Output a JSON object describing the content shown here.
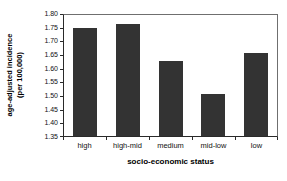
{
  "figure": {
    "background": "#ffffff"
  },
  "chart_data": {
    "type": "bar",
    "title": "",
    "categories": [
      "high",
      "high-mid",
      "medium",
      "mid-low",
      "low"
    ],
    "values": [
      1.75,
      1.765,
      1.63,
      1.505,
      1.66
    ],
    "xlabel": "socio-economic status",
    "ylabel_line1": "age-adjusted incidence",
    "ylabel_line2": "(per 100,000)",
    "ylim": [
      1.35,
      1.8
    ],
    "ytick_step": 0.05,
    "ytick_labels": [
      "1.80",
      "1.75",
      "1.70",
      "1.65",
      "1.60",
      "1.55",
      "1.50",
      "1.45",
      "1.40",
      "1.35"
    ],
    "grid": false,
    "legend": false,
    "bar_color": "#333333",
    "axis_color": "#2a2a2a",
    "frame_color": "#6f6f6f"
  }
}
